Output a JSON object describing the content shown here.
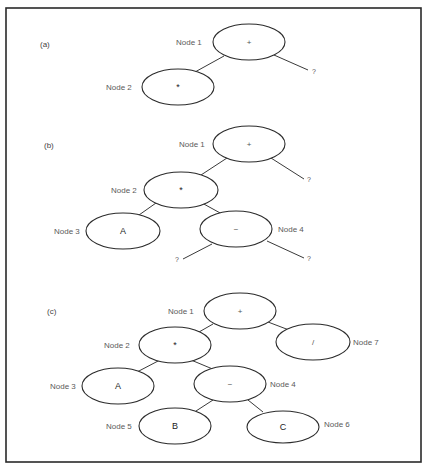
{
  "figure": {
    "frame": {
      "x": 6,
      "y": 8,
      "w": 415,
      "h": 454
    },
    "panels": [
      {
        "id": "a",
        "label": "(a)",
        "label_pos": [
          40,
          47
        ],
        "nodes": [
          {
            "name": "Node 1",
            "symbol": "+",
            "cx": 249,
            "cy": 42,
            "rx": 36,
            "ry": 18,
            "label_x": 176,
            "label_y": 45
          },
          {
            "name": "Node 2",
            "symbol": "*",
            "cx": 178,
            "cy": 87,
            "rx": 36,
            "ry": 18,
            "label_x": 106,
            "label_y": 90
          }
        ],
        "edges": [
          [
            224,
            56,
            195,
            72
          ],
          [
            274,
            55,
            308,
            70
          ]
        ],
        "unknowns": [
          {
            "text": "?",
            "x": 312,
            "y": 74
          }
        ]
      },
      {
        "id": "b",
        "label": "(b)",
        "label_pos": [
          44,
          148
        ],
        "nodes": [
          {
            "name": "Node 1",
            "symbol": "+",
            "cx": 249,
            "cy": 144,
            "rx": 36,
            "ry": 18,
            "label_x": 179,
            "label_y": 147
          },
          {
            "name": "Node 2",
            "symbol": "*",
            "cx": 181,
            "cy": 190,
            "rx": 37,
            "ry": 18,
            "label_x": 111,
            "label_y": 193
          },
          {
            "name": "Node 3",
            "symbol": "A",
            "cx": 123,
            "cy": 231,
            "rx": 37,
            "ry": 18,
            "label_x": 54,
            "label_y": 234
          },
          {
            "name": "Node 4",
            "symbol": "−",
            "cx": 236,
            "cy": 229,
            "rx": 36,
            "ry": 18,
            "label_x": 278,
            "label_y": 232
          }
        ],
        "edges": [
          [
            227,
            158,
            201,
            175
          ],
          [
            271,
            158,
            304,
            179
          ],
          [
            156,
            203,
            139,
            215
          ],
          [
            202,
            203,
            222,
            214
          ],
          [
            212,
            244,
            183,
            259
          ],
          [
            267,
            241,
            304,
            258
          ]
        ],
        "unknowns": [
          {
            "text": "?",
            "x": 307,
            "y": 182
          },
          {
            "text": "?",
            "x": 175,
            "y": 262
          },
          {
            "text": "?",
            "x": 307,
            "y": 261
          }
        ]
      },
      {
        "id": "c",
        "label": "(c)",
        "label_pos": [
          47,
          314
        ],
        "nodes": [
          {
            "name": "Node 1",
            "symbol": "+",
            "cx": 240,
            "cy": 311,
            "rx": 36,
            "ry": 18,
            "label_x": 168,
            "label_y": 314
          },
          {
            "name": "Node 2",
            "symbol": "*",
            "cx": 175,
            "cy": 345,
            "rx": 36,
            "ry": 18,
            "label_x": 104,
            "label_y": 348
          },
          {
            "name": "Node 7",
            "symbol": "/",
            "cx": 313,
            "cy": 342,
            "rx": 37,
            "ry": 18,
            "label_x": 353,
            "label_y": 345
          },
          {
            "name": "Node 3",
            "symbol": "A",
            "cx": 118,
            "cy": 386,
            "rx": 36,
            "ry": 18,
            "label_x": 50,
            "label_y": 389
          },
          {
            "name": "Node 4",
            "symbol": "−",
            "cx": 230,
            "cy": 384,
            "rx": 36,
            "ry": 18,
            "label_x": 270,
            "label_y": 387
          },
          {
            "name": "Node 5",
            "symbol": "B",
            "cx": 175,
            "cy": 426,
            "rx": 36,
            "ry": 18,
            "label_x": 106,
            "label_y": 429
          },
          {
            "name": "Node 6",
            "symbol": "C",
            "cx": 283,
            "cy": 427,
            "rx": 36,
            "ry": 16,
            "label_x": 324,
            "label_y": 427
          }
        ],
        "edges": [
          [
            213,
            324,
            199,
            332
          ],
          [
            268,
            322,
            289,
            330
          ],
          [
            160,
            360,
            137,
            372
          ],
          [
            191,
            360,
            215,
            370
          ],
          [
            213,
            400,
            196,
            411
          ],
          [
            248,
            400,
            263,
            412
          ]
        ],
        "unknowns": []
      }
    ]
  }
}
